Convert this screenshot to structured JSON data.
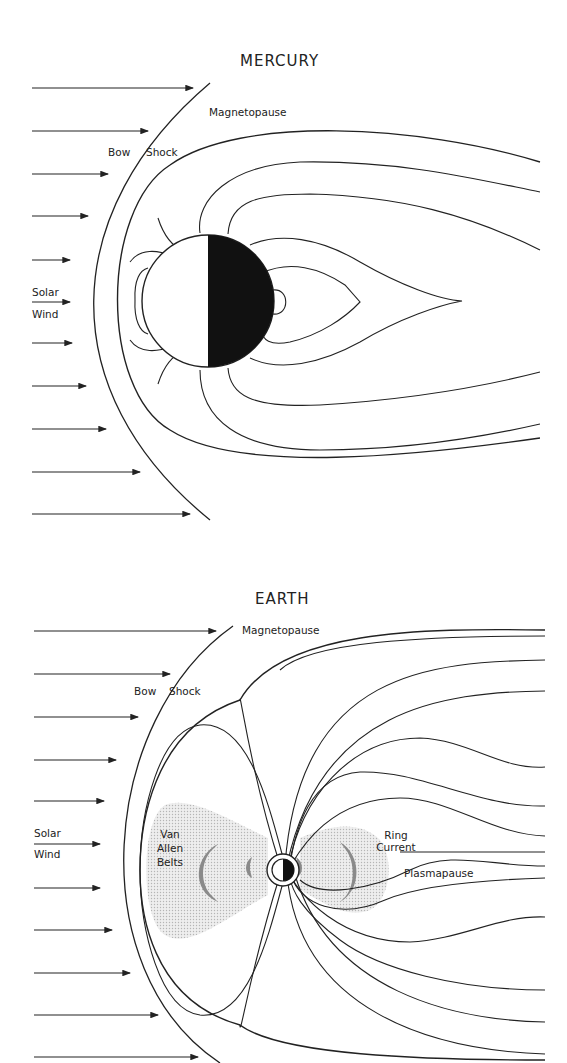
{
  "mercury": {
    "title": "MERCURY",
    "labels": {
      "magnetopause": "Magnetopause",
      "bow": "Bow",
      "shock": "Shock",
      "solar": "Solar",
      "wind": "Wind"
    }
  },
  "earth": {
    "title": "EARTH",
    "labels": {
      "magnetopause": "Magnetopause",
      "bow": "Bow",
      "shock": "Shock",
      "solar": "Solar",
      "wind": "Wind",
      "van": "Van",
      "allen": "Allen",
      "belts": "Belts",
      "ring": "Ring",
      "current": "Current",
      "plasmapause": "Plasmapause"
    }
  },
  "colors": {
    "line": "#222222",
    "shading": "#d8d8d8",
    "belt": "#8a8a8a"
  }
}
